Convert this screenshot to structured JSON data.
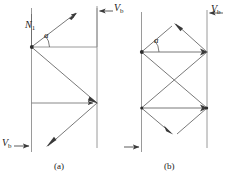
{
  "figure": {
    "panels": [
      {
        "id": "a",
        "caption": "(a)",
        "labels": {
          "normal": {
            "symbol": "N",
            "subscript": "1"
          },
          "angle": "a",
          "velocity_top": {
            "symbol": "V",
            "subscript": "b"
          },
          "velocity_bottom": {
            "symbol": "V",
            "subscript": "b"
          }
        }
      },
      {
        "id": "b",
        "caption": "(b)",
        "labels": {
          "angle": "a",
          "velocity_top": {
            "symbol": "V",
            "subscript": "b"
          }
        }
      }
    ],
    "colors": {
      "line": "#5a5a5a",
      "guide": "#8a8a8a",
      "text": "#1a1a1a",
      "background": "#ffffff"
    }
  }
}
